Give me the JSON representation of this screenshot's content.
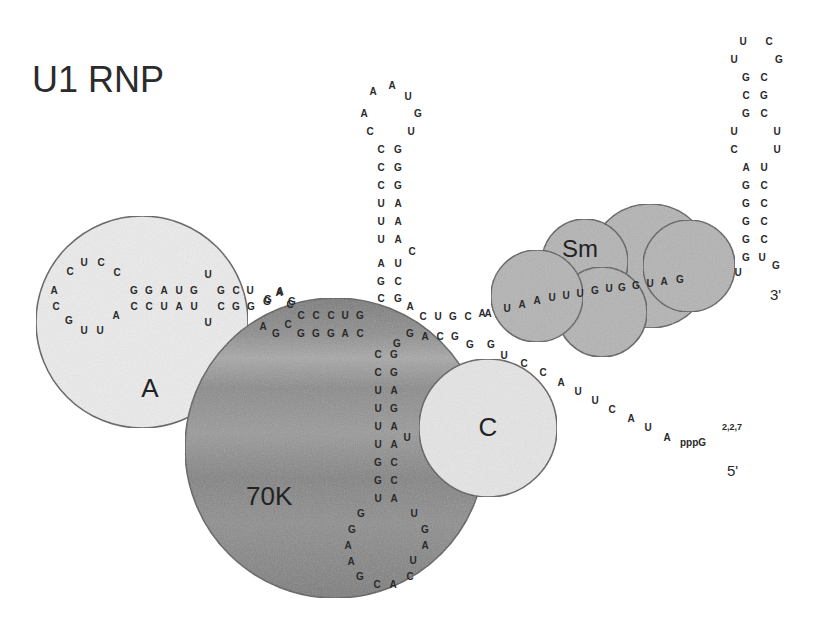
{
  "title": "U1 RNP",
  "proteins": [
    {
      "id": "A",
      "label": "A",
      "cx": 142,
      "cy": 322,
      "r": 106,
      "fill": "#ececec",
      "label_x": 150,
      "label_y": 397,
      "font_size": 26
    },
    {
      "id": "70K",
      "label": "70K",
      "cx": 335,
      "cy": 448,
      "r": 150,
      "fill": "#8c8c8c",
      "label_x": 246,
      "label_y": 505,
      "font_size": 26
    },
    {
      "id": "C",
      "label": "C",
      "cx": 488,
      "cy": 428,
      "r": 69,
      "fill": "#e6e6e6",
      "label_x": 488,
      "label_y": 436,
      "font_size": 26
    },
    {
      "id": "Sm",
      "label": "Sm",
      "parts": [
        {
          "cx": 650,
          "cy": 266,
          "r": 62
        },
        {
          "cx": 585,
          "cy": 262,
          "r": 43
        },
        {
          "cx": 689,
          "cy": 266,
          "r": 46
        },
        {
          "cx": 602,
          "cy": 312,
          "r": 45
        },
        {
          "cx": 537,
          "cy": 296,
          "r": 46
        }
      ],
      "fill": "#b4b4b4",
      "label_x": 580,
      "label_y": 257,
      "font_size": 24
    }
  ],
  "ends": {
    "three_prime": {
      "label": "3'",
      "x": 770,
      "y": 300
    },
    "five_prime": {
      "label": "5'",
      "x": 727,
      "y": 476
    },
    "cap": {
      "label": "pppG",
      "superscript": "2,2,7",
      "x": 680,
      "y": 446,
      "sup_x": 722,
      "sup_y": 430
    }
  },
  "colors": {
    "background": "#ffffff",
    "outline": "#5a5a5a",
    "text": "#2a2a2a"
  },
  "rna": {
    "stem_loop_I": [
      {
        "n": "A",
        "x": 54,
        "y": 290
      },
      {
        "n": "C",
        "x": 70,
        "y": 271
      },
      {
        "n": "U",
        "x": 84,
        "y": 262
      },
      {
        "n": "C",
        "x": 101,
        "y": 262
      },
      {
        "n": "C",
        "x": 117,
        "y": 272
      },
      {
        "n": "C",
        "x": 56,
        "y": 306
      },
      {
        "n": "G",
        "x": 69,
        "y": 320
      },
      {
        "n": "U",
        "x": 84,
        "y": 330
      },
      {
        "n": "U",
        "x": 100,
        "y": 330
      },
      {
        "n": "A",
        "x": 116,
        "y": 315
      },
      {
        "n": "G",
        "x": 134,
        "y": 290
      },
      {
        "n": "G",
        "x": 149,
        "y": 290
      },
      {
        "n": "A",
        "x": 164,
        "y": 290
      },
      {
        "n": "U",
        "x": 179,
        "y": 290
      },
      {
        "n": "G",
        "x": 194,
        "y": 290
      },
      {
        "n": "C",
        "x": 134,
        "y": 306
      },
      {
        "n": "C",
        "x": 149,
        "y": 306
      },
      {
        "n": "U",
        "x": 164,
        "y": 306
      },
      {
        "n": "A",
        "x": 179,
        "y": 306
      },
      {
        "n": "U",
        "x": 194,
        "y": 306
      },
      {
        "n": "U",
        "x": 208,
        "y": 274
      },
      {
        "n": "U",
        "x": 208,
        "y": 322
      },
      {
        "n": "G",
        "x": 221,
        "y": 290
      },
      {
        "n": "C",
        "x": 236,
        "y": 290
      },
      {
        "n": "U",
        "x": 250,
        "y": 290
      },
      {
        "n": "C",
        "x": 221,
        "y": 306
      },
      {
        "n": "G",
        "x": 236,
        "y": 306
      },
      {
        "n": "G",
        "x": 251,
        "y": 306
      },
      {
        "n": "G",
        "x": 267,
        "y": 301
      },
      {
        "n": "A",
        "x": 279,
        "y": 292
      },
      {
        "n": "C",
        "x": 290,
        "y": 304
      },
      {
        "n": "A",
        "x": 263,
        "y": 326
      },
      {
        "n": "G",
        "x": 276,
        "y": 333
      },
      {
        "n": "C",
        "x": 288,
        "y": 324
      }
    ],
    "stem_I_bridge": [
      {
        "n": "G",
        "x": 268,
        "y": 299
      },
      {
        "n": "A",
        "x": 280,
        "y": 291
      },
      {
        "n": "G",
        "x": 292,
        "y": 301
      }
    ],
    "stem_II_helix": [
      {
        "n": "C",
        "x": 301,
        "y": 315
      },
      {
        "n": "C",
        "x": 316,
        "y": 315
      },
      {
        "n": "C",
        "x": 331,
        "y": 315
      },
      {
        "n": "U",
        "x": 345,
        "y": 315
      },
      {
        "n": "G",
        "x": 360,
        "y": 315
      },
      {
        "n": "G",
        "x": 301,
        "y": 333
      },
      {
        "n": "G",
        "x": 316,
        "y": 333
      },
      {
        "n": "G",
        "x": 331,
        "y": 333
      },
      {
        "n": "A",
        "x": 345,
        "y": 333
      },
      {
        "n": "C",
        "x": 360,
        "y": 333
      }
    ],
    "stem_loop_II": [
      {
        "n": "A",
        "x": 373,
        "y": 91
      },
      {
        "n": "A",
        "x": 392,
        "y": 85
      },
      {
        "n": "U",
        "x": 408,
        "y": 96
      },
      {
        "n": "A",
        "x": 364,
        "y": 113
      },
      {
        "n": "G",
        "x": 418,
        "y": 113
      },
      {
        "n": "C",
        "x": 370,
        "y": 131
      },
      {
        "n": "U",
        "x": 411,
        "y": 131
      },
      {
        "n": "C",
        "x": 381,
        "y": 149
      },
      {
        "n": "G",
        "x": 398,
        "y": 149
      },
      {
        "n": "C",
        "x": 381,
        "y": 167
      },
      {
        "n": "G",
        "x": 398,
        "y": 167
      },
      {
        "n": "C",
        "x": 381,
        "y": 185
      },
      {
        "n": "G",
        "x": 398,
        "y": 185
      },
      {
        "n": "U",
        "x": 381,
        "y": 203
      },
      {
        "n": "A",
        "x": 398,
        "y": 203
      },
      {
        "n": "U",
        "x": 381,
        "y": 221
      },
      {
        "n": "A",
        "x": 398,
        "y": 221
      },
      {
        "n": "U",
        "x": 381,
        "y": 239
      },
      {
        "n": "A",
        "x": 398,
        "y": 239
      },
      {
        "n": "C",
        "x": 412,
        "y": 251
      },
      {
        "n": "A",
        "x": 381,
        "y": 263
      },
      {
        "n": "U",
        "x": 398,
        "y": 263
      },
      {
        "n": "G",
        "x": 381,
        "y": 281
      },
      {
        "n": "C",
        "x": 398,
        "y": 281
      },
      {
        "n": "C",
        "x": 381,
        "y": 298
      },
      {
        "n": "G",
        "x": 398,
        "y": 298
      }
    ],
    "junction": [
      {
        "n": "A",
        "x": 410,
        "y": 306
      },
      {
        "n": "C",
        "x": 423,
        "y": 316
      },
      {
        "n": "U",
        "x": 438,
        "y": 316
      },
      {
        "n": "G",
        "x": 453,
        "y": 316
      },
      {
        "n": "C",
        "x": 468,
        "y": 316
      },
      {
        "n": "A",
        "x": 482,
        "y": 313
      },
      {
        "n": "G",
        "x": 410,
        "y": 333
      },
      {
        "n": "A",
        "x": 425,
        "y": 336
      },
      {
        "n": "C",
        "x": 440,
        "y": 336
      },
      {
        "n": "G",
        "x": 455,
        "y": 336
      },
      {
        "n": "G",
        "x": 470,
        "y": 344
      },
      {
        "n": "G",
        "x": 397,
        "y": 343
      }
    ],
    "stem_loop_III": [
      {
        "n": "C",
        "x": 378,
        "y": 354
      },
      {
        "n": "G",
        "x": 394,
        "y": 354
      },
      {
        "n": "C",
        "x": 378,
        "y": 372
      },
      {
        "n": "G",
        "x": 394,
        "y": 372
      },
      {
        "n": "U",
        "x": 378,
        "y": 390
      },
      {
        "n": "A",
        "x": 394,
        "y": 390
      },
      {
        "n": "U",
        "x": 378,
        "y": 408
      },
      {
        "n": "G",
        "x": 394,
        "y": 408
      },
      {
        "n": "U",
        "x": 378,
        "y": 426
      },
      {
        "n": "A",
        "x": 394,
        "y": 426
      },
      {
        "n": "U",
        "x": 407,
        "y": 437
      },
      {
        "n": "U",
        "x": 378,
        "y": 444
      },
      {
        "n": "A",
        "x": 394,
        "y": 444
      },
      {
        "n": "G",
        "x": 378,
        "y": 462
      },
      {
        "n": "C",
        "x": 394,
        "y": 462
      },
      {
        "n": "G",
        "x": 378,
        "y": 480
      },
      {
        "n": "C",
        "x": 394,
        "y": 480
      },
      {
        "n": "U",
        "x": 378,
        "y": 498
      },
      {
        "n": "A",
        "x": 394,
        "y": 498
      },
      {
        "n": "G",
        "x": 361,
        "y": 513
      },
      {
        "n": "G",
        "x": 352,
        "y": 529
      },
      {
        "n": "A",
        "x": 348,
        "y": 545
      },
      {
        "n": "A",
        "x": 351,
        "y": 561
      },
      {
        "n": "G",
        "x": 360,
        "y": 576
      },
      {
        "n": "C",
        "x": 377,
        "y": 584
      },
      {
        "n": "A",
        "x": 393,
        "y": 584
      },
      {
        "n": "C",
        "x": 410,
        "y": 576
      },
      {
        "n": "U",
        "x": 413,
        "y": 560
      },
      {
        "n": "A",
        "x": 425,
        "y": 545
      },
      {
        "n": "G",
        "x": 425,
        "y": 529
      },
      {
        "n": "U",
        "x": 414,
        "y": 513
      }
    ],
    "sm_site": [
      {
        "n": "A",
        "x": 488,
        "y": 313
      },
      {
        "n": "U",
        "x": 507,
        "y": 308
      },
      {
        "n": "A",
        "x": 522,
        "y": 304
      },
      {
        "n": "A",
        "x": 537,
        "y": 300
      },
      {
        "n": "U",
        "x": 552,
        "y": 297
      },
      {
        "n": "U",
        "x": 566,
        "y": 295
      },
      {
        "n": "U",
        "x": 580,
        "y": 293
      },
      {
        "n": "G",
        "x": 595,
        "y": 290
      },
      {
        "n": "U",
        "x": 609,
        "y": 288
      },
      {
        "n": "G",
        "x": 622,
        "y": 287
      },
      {
        "n": "G",
        "x": 636,
        "y": 285
      },
      {
        "n": "U",
        "x": 650,
        "y": 283
      },
      {
        "n": "A",
        "x": 664,
        "y": 281
      },
      {
        "n": "G",
        "x": 680,
        "y": 279
      },
      {
        "n": "U",
        "x": 738,
        "y": 272
      }
    ],
    "stem_loop_IV": [
      {
        "n": "U",
        "x": 743,
        "y": 41
      },
      {
        "n": "C",
        "x": 769,
        "y": 41
      },
      {
        "n": "U",
        "x": 734,
        "y": 59
      },
      {
        "n": "G",
        "x": 779,
        "y": 59
      },
      {
        "n": "G",
        "x": 746,
        "y": 77
      },
      {
        "n": "C",
        "x": 764,
        "y": 77
      },
      {
        "n": "C",
        "x": 746,
        "y": 95
      },
      {
        "n": "G",
        "x": 764,
        "y": 95
      },
      {
        "n": "G",
        "x": 746,
        "y": 113
      },
      {
        "n": "C",
        "x": 764,
        "y": 113
      },
      {
        "n": "U",
        "x": 734,
        "y": 131
      },
      {
        "n": "U",
        "x": 777,
        "y": 131
      },
      {
        "n": "C",
        "x": 734,
        "y": 149
      },
      {
        "n": "U",
        "x": 777,
        "y": 149
      },
      {
        "n": "A",
        "x": 746,
        "y": 167
      },
      {
        "n": "U",
        "x": 764,
        "y": 167
      },
      {
        "n": "G",
        "x": 746,
        "y": 185
      },
      {
        "n": "C",
        "x": 764,
        "y": 185
      },
      {
        "n": "G",
        "x": 746,
        "y": 203
      },
      {
        "n": "C",
        "x": 764,
        "y": 203
      },
      {
        "n": "G",
        "x": 746,
        "y": 221
      },
      {
        "n": "C",
        "x": 764,
        "y": 221
      },
      {
        "n": "G",
        "x": 746,
        "y": 239
      },
      {
        "n": "C",
        "x": 764,
        "y": 239
      },
      {
        "n": "G",
        "x": 746,
        "y": 257
      },
      {
        "n": "U",
        "x": 762,
        "y": 257
      },
      {
        "n": "G",
        "x": 776,
        "y": 265
      }
    ],
    "five_prime_tail": [
      {
        "n": "G",
        "x": 491,
        "y": 344
      },
      {
        "n": "U",
        "x": 504,
        "y": 355
      },
      {
        "n": "C",
        "x": 524,
        "y": 363
      },
      {
        "n": "C",
        "x": 543,
        "y": 372
      },
      {
        "n": "A",
        "x": 561,
        "y": 382
      },
      {
        "n": "U",
        "x": 578,
        "y": 391
      },
      {
        "n": "U",
        "x": 595,
        "y": 400
      },
      {
        "n": "C",
        "x": 612,
        "y": 409
      },
      {
        "n": "A",
        "x": 631,
        "y": 418
      },
      {
        "n": "U",
        "x": 648,
        "y": 427
      },
      {
        "n": "A",
        "x": 667,
        "y": 437
      }
    ]
  }
}
